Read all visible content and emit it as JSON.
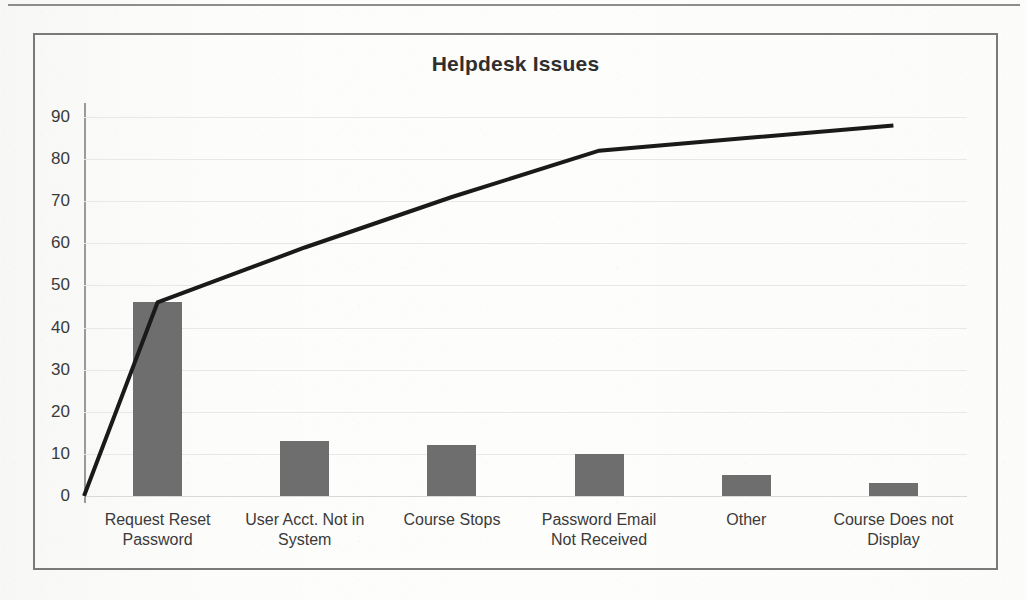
{
  "document": {
    "has_top_rule": true,
    "background_style": "scanned-photocopy"
  },
  "chart_frame": {
    "border_color": "#7a7a7a"
  },
  "chart_data": {
    "type": "bar",
    "title": "Helpdesk Issues",
    "subtitle": "",
    "xlabel": "",
    "ylabel": "",
    "ylim": [
      0,
      90
    ],
    "ytick_step": 10,
    "yticks": [
      0,
      10,
      20,
      30,
      40,
      50,
      60,
      70,
      80,
      90
    ],
    "ytick_labels": [
      "0",
      "10",
      "20",
      "30",
      "40",
      "50",
      "60",
      "70",
      "80",
      "90"
    ],
    "grid": true,
    "grid_axis": "y",
    "legend": false,
    "legend_position": "none",
    "categories": [
      "Request Reset Password",
      "User Acct. Not in System",
      "Course Stops",
      "Password Email Not Received",
      "Other",
      "Course Does not Display"
    ],
    "category_lines": [
      [
        "Request Reset",
        "Password"
      ],
      [
        "User Acct. Not in",
        "System"
      ],
      [
        "Course Stops"
      ],
      [
        "Password Email",
        "Not Received"
      ],
      [
        "Other"
      ],
      [
        "Course Does not",
        "Display"
      ]
    ],
    "values": [
      46,
      13,
      12,
      10,
      5,
      3
    ],
    "series": [
      {
        "name": "Count",
        "type": "bar",
        "values": [
          46,
          13,
          12,
          10,
          5,
          3
        ],
        "color": "#6e6e6e"
      },
      {
        "name": "Cumulative",
        "type": "line",
        "values": [
          46,
          59,
          71,
          82,
          85,
          88
        ],
        "color": "#1a1a1a",
        "starts_at_origin": true,
        "origin_value": 0
      }
    ],
    "colors": {
      "bar": "#6e6e6e",
      "line": "#1a1a1a",
      "gridline": "#e8e8e6",
      "axis": "#9a9a9a",
      "text": "#3a3a3a",
      "title": "#2f2f2f"
    }
  }
}
